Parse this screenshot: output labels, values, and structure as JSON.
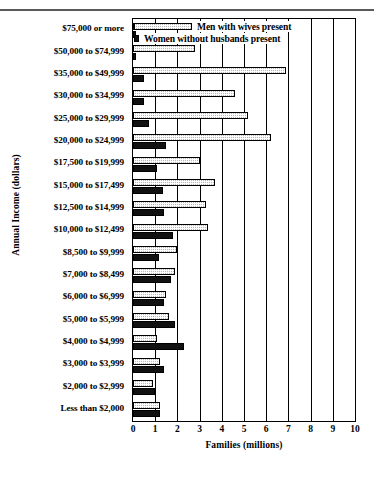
{
  "chart_data": {
    "type": "bar",
    "orientation": "horizontal",
    "title": "",
    "xlabel": "Families (millions)",
    "ylabel": "Annual Income (dollars)",
    "xlim": [
      0,
      10
    ],
    "xticks": [
      0,
      1,
      2,
      3,
      4,
      5,
      6,
      7,
      8,
      9,
      10
    ],
    "grid": true,
    "legend_position": "top-left-inside",
    "categories": [
      "$75,000 or more",
      "$50,000 to $74,999",
      "$35,000 to $49,999",
      "$30,000 to $34,999",
      "$25,000 to $29,999",
      "$20,000 to $24,999",
      "$17,500 to $19,999",
      "$15,000 to $17,499",
      "$12,500 to $14,999",
      "$10,000 to $12,499",
      "$8,500 to $9,999",
      "$7,000 to $8,499",
      "$6,000 to $6,999",
      "$5,000 to $5,999",
      "$4,000 to $4,999",
      "$3,000 to $3,999",
      "$2,000 to $2,999",
      "Less than $2,000"
    ],
    "series": [
      {
        "name": "Men with wives present",
        "pattern": "stippled",
        "color": "#b9b9b9",
        "values": [
          2.3,
          2.8,
          6.9,
          4.6,
          5.2,
          6.2,
          3.0,
          3.7,
          3.3,
          3.4,
          2.0,
          1.9,
          1.5,
          1.6,
          1.1,
          1.2,
          0.9,
          1.2
        ]
      },
      {
        "name": "Women without husbands present",
        "pattern": "solid",
        "color": "#111111",
        "values": [
          0.1,
          0.15,
          0.5,
          0.5,
          0.7,
          1.5,
          1.1,
          1.35,
          1.4,
          1.8,
          1.15,
          1.7,
          1.4,
          1.9,
          2.3,
          1.4,
          1.0,
          1.2
        ]
      }
    ]
  },
  "legend": {
    "items": [
      {
        "label": "Men with wives present",
        "swatch": "men-swatch"
      },
      {
        "label": "Women without husbands present",
        "swatch": "women-swatch"
      }
    ]
  }
}
